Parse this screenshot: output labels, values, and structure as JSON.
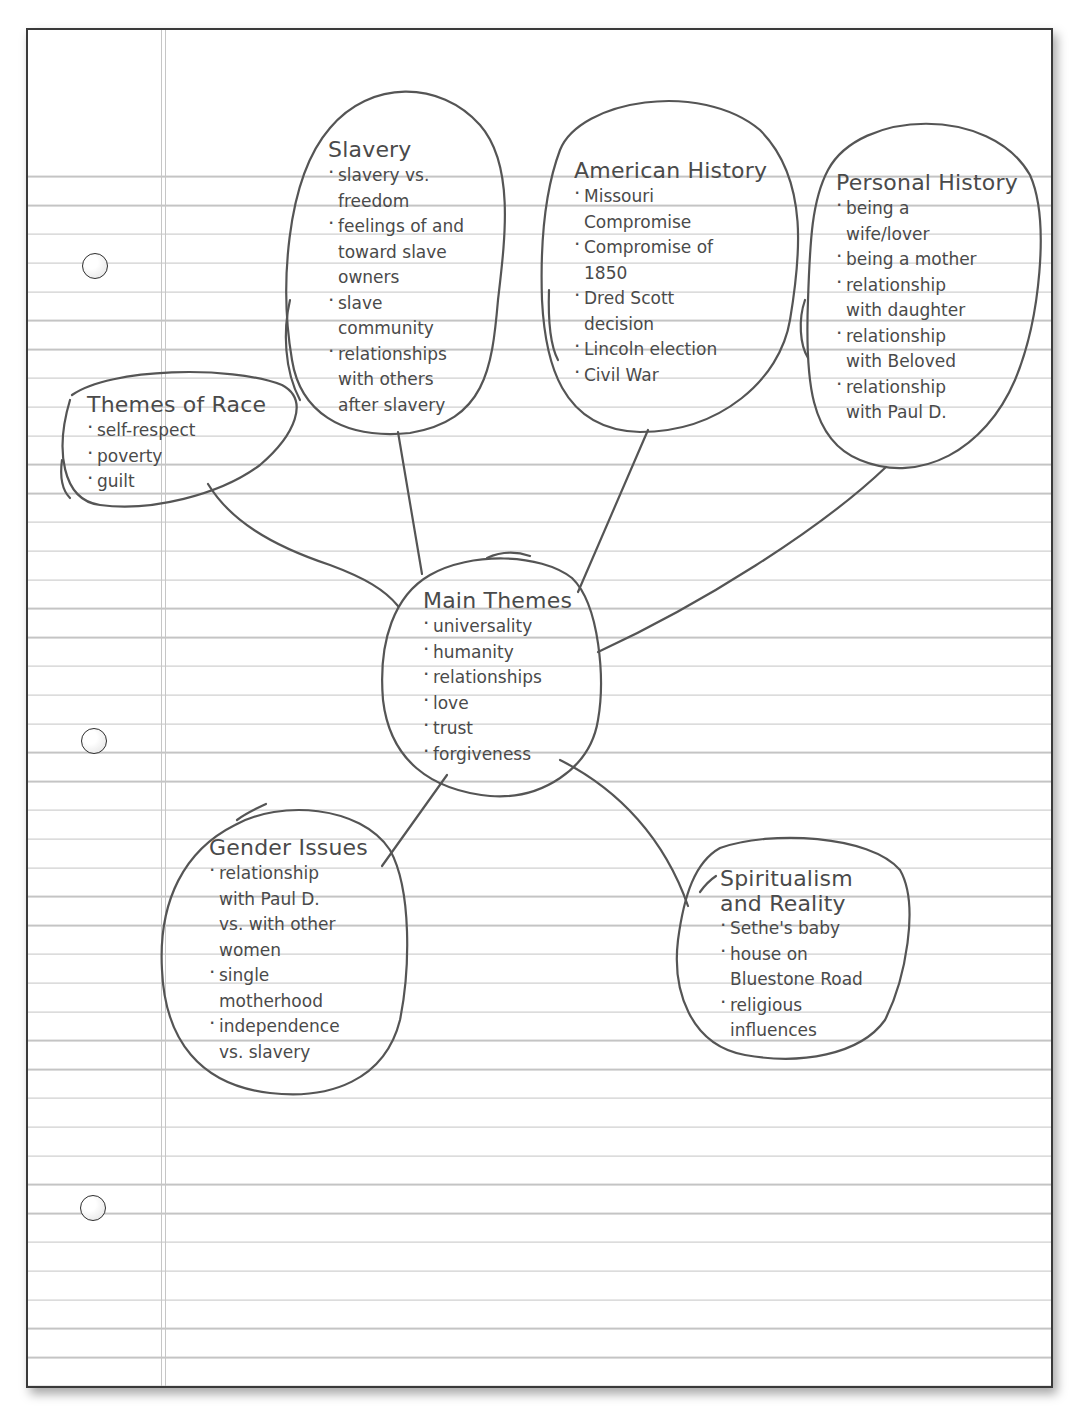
{
  "document": {
    "type": "lined notebook paper",
    "ink_color": "#555555",
    "rule_color": "#c4c4c4",
    "margin_color": "#c6c6c6"
  },
  "mind_map": {
    "center": {
      "title": "Main Themes",
      "items": [
        "universality",
        "humanity",
        "relationships",
        "love",
        "trust",
        "forgiveness"
      ]
    },
    "nodes": [
      {
        "id": "race",
        "title": "Themes of Race",
        "items": [
          "self-respect",
          "poverty",
          "guilt"
        ]
      },
      {
        "id": "slavery",
        "title": "Slavery",
        "items": [
          "slavery vs.\nfreedom",
          "feelings of and\ntoward slave\nowners",
          "slave\ncommunity",
          "relationships\nwith others\nafter slavery"
        ]
      },
      {
        "id": "american",
        "title": "American History",
        "items": [
          "Missouri\nCompromise",
          "Compromise of\n1850",
          "Dred Scott\ndecision",
          "Lincoln election",
          "Civil War"
        ]
      },
      {
        "id": "personal",
        "title": "Personal History",
        "items": [
          "being a\nwife/lover",
          "being a mother",
          "relationship\nwith daughter",
          "relationship\nwith Beloved",
          "relationship\nwith Paul D."
        ]
      },
      {
        "id": "gender",
        "title": "Gender Issues",
        "items": [
          "relationship\nwith Paul D.\nvs. with other\nwomen",
          "single\nmotherhood",
          "independence\nvs. slavery"
        ]
      },
      {
        "id": "spiritualism",
        "title": "Spiritualism\nand Reality",
        "items": [
          "Sethe's baby",
          "house on\nBluestone Road",
          "religious\ninfluences"
        ]
      }
    ]
  }
}
